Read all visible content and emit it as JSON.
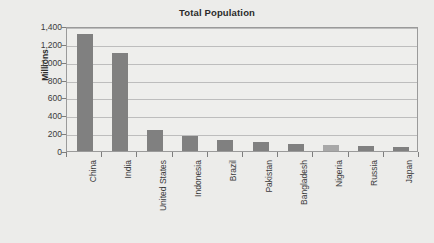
{
  "chart_data": {
    "type": "bar",
    "title": "Total Population",
    "xlabel": "",
    "ylabel": "Millions",
    "categories": [
      "China",
      "India",
      "United States",
      "Indonesia",
      "Brazil",
      "Pakistan",
      "Bangladesh",
      "Nigeria",
      "Russia",
      "Japan"
    ],
    "values": [
      1310,
      1100,
      240,
      170,
      125,
      105,
      78,
      70,
      58,
      45
    ],
    "series": [
      {
        "name": "Total Population",
        "values": [
          1310,
          1100,
          240,
          170,
          125,
          105,
          78,
          70,
          58,
          45
        ]
      }
    ],
    "ylim": [
      0,
      1400
    ],
    "ytick_values": [
      0,
      200,
      400,
      600,
      800,
      1000,
      1200,
      1400
    ],
    "ytick_labels": [
      "0",
      "200",
      "400",
      "600",
      "800",
      "1,000",
      "1,200",
      "1,400"
    ],
    "grid": true,
    "legend": false,
    "bar_color": "#808080",
    "highlight_bar_color": "#a8a8a8",
    "highlight_category": "Nigeria",
    "plot_background": "#eeeeec",
    "page_background": "#ececea",
    "gridline_color": "#bdbdbd",
    "axis_color": "#9a9a9a"
  }
}
